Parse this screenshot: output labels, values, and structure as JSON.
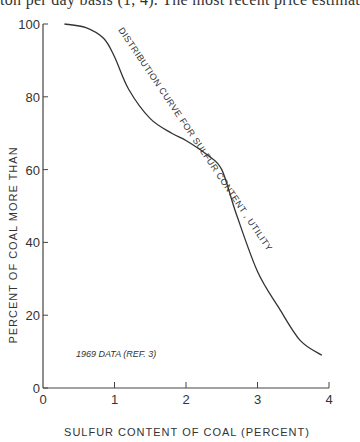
{
  "page_header": {
    "text": "ton per day basis (1, 4). The most recent price estimat"
  },
  "chart_data": {
    "type": "line",
    "title": "",
    "xlabel": "SULFUR CONTENT OF COAL (PERCENT)",
    "ylabel": "PERCENT OF COAL MORE THAN",
    "xlim": [
      0,
      4
    ],
    "ylim": [
      0,
      100
    ],
    "x_ticks": [
      "0",
      "1",
      "2",
      "3",
      "4"
    ],
    "y_ticks": [
      "0",
      "20",
      "40",
      "60",
      "80",
      "100"
    ],
    "grid": false,
    "series": [
      {
        "name": "DISTRIBUTION CURVE FOR SULFUR CONTENT, UTILITY",
        "x": [
          0.3,
          0.6,
          0.85,
          1.0,
          1.2,
          1.5,
          1.8,
          2.0,
          2.3,
          2.5,
          2.7,
          3.0,
          3.3,
          3.6,
          3.9
        ],
        "y": [
          100,
          99,
          96,
          91,
          82,
          74,
          70,
          68,
          64,
          60,
          48,
          32,
          22,
          13,
          9
        ]
      }
    ],
    "annotations": [
      "DISTRIBUTION CURVE FOR SULFUR CONTENT, UTILITY",
      "1969 DATA (REF. 3)"
    ]
  }
}
